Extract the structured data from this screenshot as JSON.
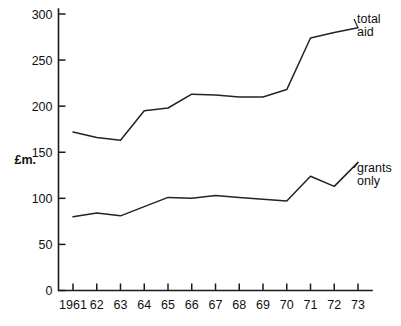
{
  "chart_data": {
    "type": "line",
    "title": "",
    "subtitle": "",
    "xlabel": "",
    "ylabel": "£m.",
    "ylim": [
      0,
      300
    ],
    "yticks": [
      0,
      50,
      100,
      150,
      200,
      250,
      300
    ],
    "ytick_labels": [
      "0",
      "50",
      "100",
      "150",
      "200",
      "250",
      "300"
    ],
    "grid": false,
    "legend_position": "right-inline-annotation",
    "categories": [
      "1961",
      "62",
      "63",
      "64",
      "65",
      "66",
      "67",
      "68",
      "69",
      "70",
      "71",
      "72",
      "73"
    ],
    "x": [
      1961,
      1962,
      1963,
      1964,
      1965,
      1966,
      1967,
      1968,
      1969,
      1970,
      1971,
      1972,
      1973
    ],
    "series": [
      {
        "name": "total aid",
        "label_lines": [
          "total",
          "aid"
        ],
        "color": "#232323",
        "values": [
          172,
          166,
          163,
          195,
          198,
          213,
          212,
          210,
          210,
          218,
          274,
          280,
          285
        ]
      },
      {
        "name": "grants only",
        "label_lines": [
          "grants",
          "only"
        ],
        "color": "#232323",
        "values": [
          80,
          84,
          81,
          91,
          101,
          100,
          103,
          101,
          99,
          97,
          124,
          113,
          139
        ]
      }
    ],
    "annotations": [
      {
        "text": "total aid",
        "series": "total aid",
        "attach_x": 1973
      },
      {
        "text": "grants only",
        "series": "grants only",
        "attach_x": 1973
      }
    ]
  },
  "axes": {
    "unit_label": "£m.",
    "y_tick_labels": [
      "300",
      "250",
      "200",
      "150",
      "100",
      "50",
      "0"
    ],
    "x_tick_labels": [
      "1961",
      "62",
      "63",
      "64",
      "65",
      "66",
      "67",
      "68",
      "69",
      "70",
      "71",
      "72",
      "73"
    ]
  },
  "labels": {
    "total_aid_line1": "total",
    "total_aid_line2": "aid",
    "grants_only_line1": "grants",
    "grants_only_line2": "only"
  }
}
